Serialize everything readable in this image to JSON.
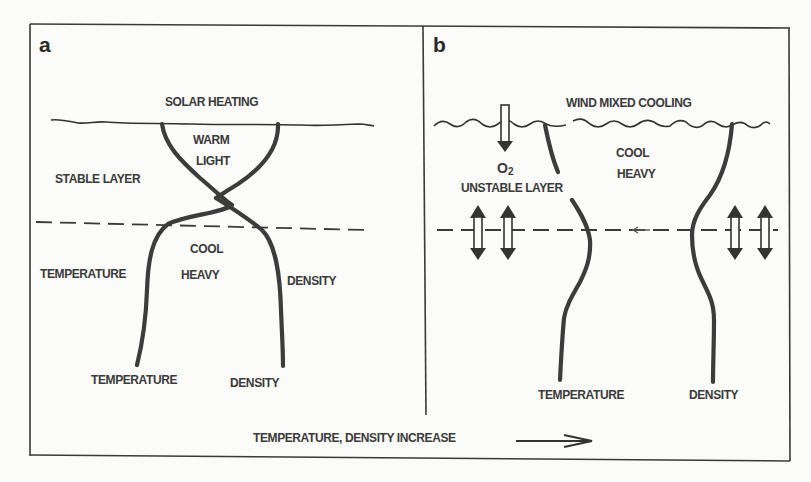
{
  "figure": {
    "background": "#fbfbf9",
    "ink_color": "#3a3a3a",
    "bottom_axis_label": "TEMPERATURE, DENSITY INCREASE",
    "bottom_axis_arrow": "right-arrow"
  },
  "panel_a": {
    "letter": "a",
    "surface_label": "SOLAR HEATING",
    "upper_zone_labels": [
      "WARM",
      "LIGHT"
    ],
    "layer_label": "STABLE LAYER",
    "lower_zone_labels": [
      "COOL",
      "HEAVY"
    ],
    "side_label_left": "TEMPERATURE",
    "side_label_right": "DENSITY",
    "bottom_label_temperature": "TEMPERATURE",
    "bottom_label_density": "DENSITY"
  },
  "panel_b": {
    "letter": "b",
    "surface_label": "WIND MIXED COOLING",
    "gas_label": "O",
    "gas_subscript": "2",
    "layer_label": "UNSTABLE LAYER",
    "zone_labels": [
      "COOL",
      "HEAVY"
    ],
    "bottom_label_temperature": "TEMPERATURE",
    "bottom_label_density": "DENSITY",
    "icons": [
      "down-arrow-oxygen-icon",
      "double-headed-vertical-arrow-icon"
    ]
  }
}
